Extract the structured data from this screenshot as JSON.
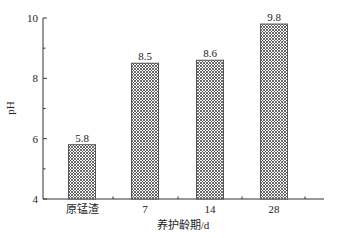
{
  "chart_data": {
    "type": "bar",
    "title": "",
    "xlabel": "养护龄期/d",
    "ylabel": "pH",
    "categories": [
      "原锰渣",
      "7",
      "14",
      "28"
    ],
    "values": [
      5.8,
      8.5,
      8.6,
      9.8
    ],
    "data_labels": [
      "5.8",
      "8.5",
      "8.6",
      "9.8"
    ],
    "ylim": [
      4,
      10
    ],
    "yticks": [
      "4",
      "6",
      "8",
      "10"
    ],
    "grid": false,
    "legend": null,
    "bar_pattern": "crosshatch"
  },
  "colors": {
    "bar_outline": "#555555",
    "hatch": "#444444",
    "axis": "#333333"
  }
}
